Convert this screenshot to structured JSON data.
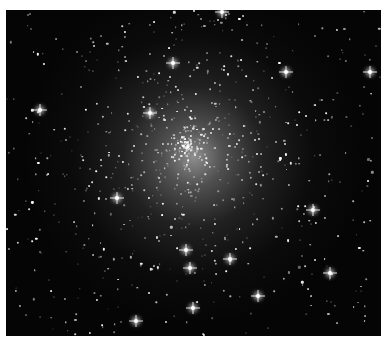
{
  "image": {
    "subject": "globular star cluster",
    "background_color": "#050505",
    "core_center": {
      "x": 188,
      "y": 147
    },
    "bright_stars": [
      {
        "x": 40,
        "y": 110
      },
      {
        "x": 150,
        "y": 113
      },
      {
        "x": 286,
        "y": 72
      },
      {
        "x": 173,
        "y": 63
      },
      {
        "x": 186,
        "y": 250
      },
      {
        "x": 230,
        "y": 259
      },
      {
        "x": 330,
        "y": 273
      },
      {
        "x": 136,
        "y": 321
      },
      {
        "x": 258,
        "y": 296
      },
      {
        "x": 190,
        "y": 268
      },
      {
        "x": 117,
        "y": 198
      },
      {
        "x": 313,
        "y": 210
      },
      {
        "x": 370,
        "y": 72
      },
      {
        "x": 222,
        "y": 12
      },
      {
        "x": 193,
        "y": 308
      }
    ]
  }
}
